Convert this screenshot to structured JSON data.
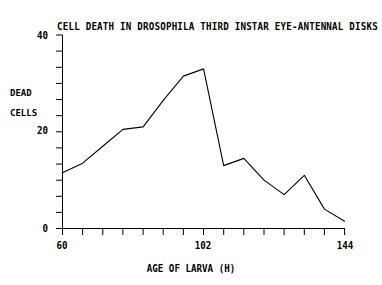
{
  "chart_data": {
    "type": "line",
    "title": "CELL DEATH IN DROSOPHILA THIRD INSTAR EYE-ANTENNAL DISKS",
    "xlabel": "AGE OF LARVA (H)",
    "ylabel": "DEAD CELLS",
    "ylabel_line1": "DEAD",
    "ylabel_line2": "CELLS",
    "xlim": [
      60,
      144
    ],
    "ylim": [
      0,
      40
    ],
    "xticks": [
      60,
      66,
      72,
      78,
      84,
      90,
      96,
      102,
      108,
      114,
      120,
      126,
      132,
      138,
      144
    ],
    "xtick_labels": [
      "60",
      "102",
      "144"
    ],
    "xtick_labeled_values": [
      60,
      102,
      144
    ],
    "yticks": [
      0,
      3.33,
      6.67,
      10,
      13.33,
      16.67,
      20,
      23.33,
      26.67,
      30,
      33.33,
      36.67,
      40
    ],
    "ytick_labels": [
      "0",
      "20",
      "40"
    ],
    "ytick_labeled_values": [
      0,
      20,
      40
    ],
    "grid": false,
    "legend": false,
    "line_color": "#000000",
    "background": "#ffffff",
    "x": [
      60,
      66,
      72,
      78,
      84,
      90,
      96,
      102,
      108,
      114,
      120,
      126,
      132,
      138,
      144
    ],
    "values": [
      11.5,
      13.5,
      17.0,
      20.5,
      21.0,
      26.5,
      31.5,
      33.0,
      13.0,
      14.5,
      10.0,
      7.0,
      11.0,
      4.0,
      1.5
    ],
    "series": [
      {
        "name": "dead cells",
        "values": [
          11.5,
          13.5,
          17.0,
          20.5,
          21.0,
          26.5,
          31.5,
          33.0,
          13.0,
          14.5,
          10.0,
          7.0,
          11.0,
          4.0,
          1.5
        ]
      }
    ]
  }
}
